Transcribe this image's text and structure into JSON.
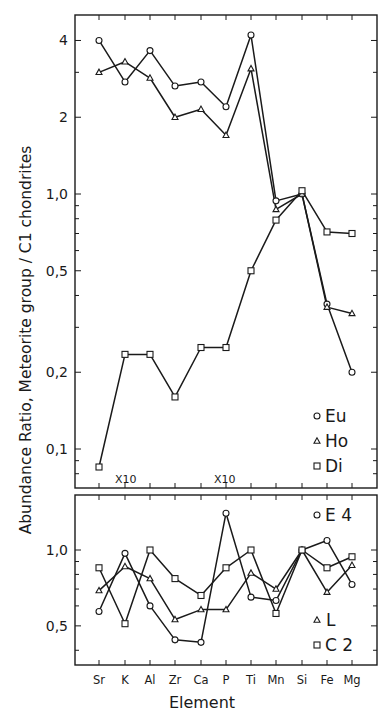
{
  "chart_data": [
    {
      "type": "line",
      "panel": "upper",
      "title": "",
      "xlabel": "Element",
      "ylabel": "Ratio, Meteorite group / C1 chondrites",
      "yscale": "log",
      "ylim": [
        0.065,
        5.0
      ],
      "yticks": [
        0.1,
        0.2,
        0.5,
        1.0,
        2,
        4
      ],
      "ytick_labels": [
        "0,1",
        "0,2",
        "0,5",
        "1,0",
        "2",
        "4"
      ],
      "categories": [
        "Sr",
        "K",
        "Al",
        "Zr",
        "Ca",
        "P",
        "Ti",
        "Mn",
        "Si",
        "Fe",
        "Mg"
      ],
      "series": [
        {
          "name": "Eu",
          "marker": "circle",
          "values": [
            4.0,
            2.75,
            3.65,
            2.65,
            2.75,
            2.2,
            4.2,
            0.94,
            1.0,
            0.37,
            0.2
          ]
        },
        {
          "name": "Ho",
          "marker": "triangle",
          "values": [
            3.0,
            3.3,
            2.85,
            2.0,
            2.15,
            1.7,
            3.1,
            0.87,
            1.0,
            0.36,
            0.34
          ]
        },
        {
          "name": "Di",
          "marker": "square",
          "values": [
            0.085,
            0.235,
            0.235,
            0.16,
            0.25,
            0.25,
            0.5,
            0.79,
            1.03,
            0.71,
            0.7
          ]
        }
      ],
      "annotations": [
        {
          "text": "X10",
          "at": "K"
        },
        {
          "text": "X10",
          "at": "P"
        }
      ],
      "legend": [
        "Eu",
        "Ho",
        "Di"
      ],
      "legend_position": "lower right",
      "grid": false
    },
    {
      "type": "line",
      "panel": "lower",
      "title": "",
      "xlabel": "Element",
      "ylabel": "Abundance",
      "yscale": "log",
      "ylim": [
        0.38,
        1.65
      ],
      "yticks": [
        0.5,
        1.0
      ],
      "ytick_labels": [
        "0,5",
        "1,0"
      ],
      "categories": [
        "Sr",
        "K",
        "Al",
        "Zr",
        "Ca",
        "P",
        "Ti",
        "Mn",
        "Si",
        "Fe",
        "Mg"
      ],
      "series": [
        {
          "name": "E 4",
          "marker": "circle",
          "values": [
            0.57,
            0.97,
            0.6,
            0.44,
            0.43,
            1.4,
            0.65,
            0.63,
            1.0,
            1.09,
            0.73
          ]
        },
        {
          "name": "L",
          "marker": "triangle",
          "values": [
            0.69,
            0.86,
            0.77,
            0.53,
            0.58,
            0.58,
            0.81,
            0.7,
            1.0,
            0.68,
            0.87
          ]
        },
        {
          "name": "C 2",
          "marker": "square",
          "values": [
            0.85,
            0.51,
            1.0,
            0.77,
            0.66,
            0.85,
            1.0,
            0.56,
            1.0,
            0.85,
            0.94
          ]
        }
      ],
      "legend": [
        "E 4",
        "L",
        "C 2"
      ],
      "legend_position": "right",
      "grid": false
    }
  ],
  "labels": {
    "ylabel_text": "Abundance  Ratio,  Meteorite  group / C1  chondrites",
    "xlabel_text": "Element",
    "annotation_1": "X10",
    "annotation_2": "X10",
    "legend_upper": [
      "Eu",
      "Ho",
      "Di"
    ],
    "legend_lower": [
      "E 4",
      "L",
      "C 2"
    ]
  },
  "colors": {
    "ink": "#1a1a1a",
    "background": "#ffffff"
  }
}
